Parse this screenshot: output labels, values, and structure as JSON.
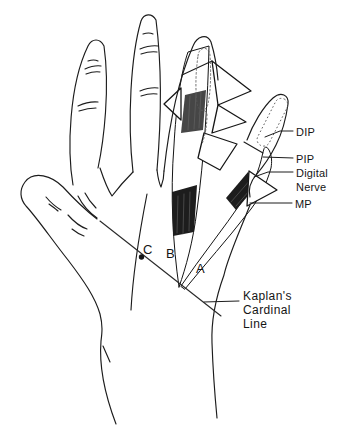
{
  "figure": {
    "background_color": "#ffffff",
    "ink_color": "#1c1c1c",
    "labels": {
      "dip": "DIP",
      "pip": "PIP",
      "digital_nerve_line1": "Digital",
      "digital_nerve_line2": "Nerve",
      "mp": "MP",
      "kaplans_line1": "Kaplan's",
      "kaplans_line2": "Cardinal",
      "kaplans_line3": "Line",
      "point_a": "A",
      "point_b": "B",
      "point_c": "C"
    }
  }
}
